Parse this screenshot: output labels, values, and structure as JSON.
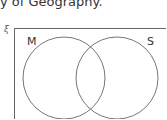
{
  "caption": "y of Geography.",
  "venn": {
    "universal_symbol": "ξ",
    "sets": [
      {
        "label": "M"
      },
      {
        "label": "S"
      }
    ]
  }
}
